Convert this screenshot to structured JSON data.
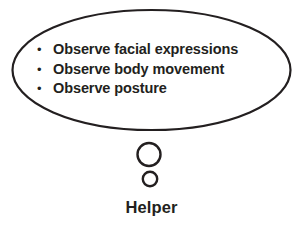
{
  "diagram": {
    "type": "thought-bubble-diagram",
    "background_color": "#ffffff",
    "stroke_color": "#231f20",
    "text_color": "#231f20",
    "bubble": {
      "shape": "ellipse",
      "center_x": 151.5,
      "center_y": 70,
      "radius_x": 139,
      "radius_y": 60,
      "stroke_width": 2.2
    },
    "bullets": [
      {
        "marker": "•",
        "label": "Observe facial expressions"
      },
      {
        "marker": "•",
        "label": "Observe body movement"
      },
      {
        "marker": "•",
        "label": "Observe posture"
      }
    ],
    "figure": {
      "label": "Helper",
      "head": {
        "cx": 149,
        "cy": 154.5,
        "r": 11.5,
        "stroke_width": 2.4
      },
      "body": {
        "cx": 150,
        "cy": 179,
        "r": 7.2,
        "stroke_width": 2.4
      }
    }
  }
}
